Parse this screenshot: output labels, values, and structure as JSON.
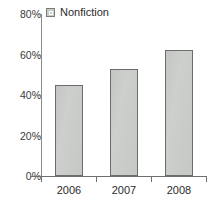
{
  "chart_data": {
    "type": "bar",
    "title": "",
    "xlabel": "",
    "ylabel": "",
    "categories": [
      "2006",
      "2007",
      "2008"
    ],
    "series": [
      {
        "name": "Nonfiction",
        "values": [
          45,
          53,
          62
        ],
        "color": "#c9cbc9",
        "border_color": "#6b6d6b"
      }
    ],
    "ylim": [
      0,
      80
    ],
    "y_ticks": [
      0,
      20,
      40,
      60,
      80
    ],
    "y_tick_labels": [
      "0%",
      "20%",
      "40%",
      "60%",
      "80%"
    ],
    "grid": false,
    "legend_position": "top-left",
    "legend": [
      "Nonfiction"
    ],
    "value_format": "percent"
  },
  "legend": {
    "swatch_name": "legend-swatch-nonfiction",
    "label": "Nonfiction"
  },
  "axes": {
    "y_labels": [
      "80%",
      "60%",
      "40%",
      "20%",
      "0%"
    ],
    "x_labels": [
      "2006",
      "2007",
      "2008"
    ]
  }
}
